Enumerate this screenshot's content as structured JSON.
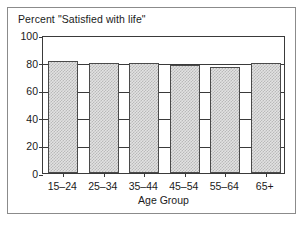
{
  "chart_data": {
    "type": "bar",
    "title": "Percent \"Satisfied with life\"",
    "xlabel": "Age Group",
    "ylabel": "",
    "categories": [
      "15–24",
      "25–34",
      "35–44",
      "45–54",
      "55–64",
      "65+"
    ],
    "values": [
      81,
      80,
      80,
      78,
      77,
      80
    ],
    "ylim": [
      0,
      100
    ],
    "yticks": [
      0,
      20,
      40,
      60,
      80,
      100
    ],
    "ytick_labels": [
      "0",
      "20",
      "40",
      "60",
      "80",
      "100"
    ],
    "grid": true,
    "legend": false,
    "bar_fill_color": "#e2e2e2",
    "bar_hatch_color": "#b9b9b9",
    "bar_edge_color": "#4a4a4a",
    "axis_color": "#3a3a3a",
    "frame_color": "#8b8b8b",
    "background_color": "#ffffff",
    "text_color": "#1a1a1a"
  }
}
